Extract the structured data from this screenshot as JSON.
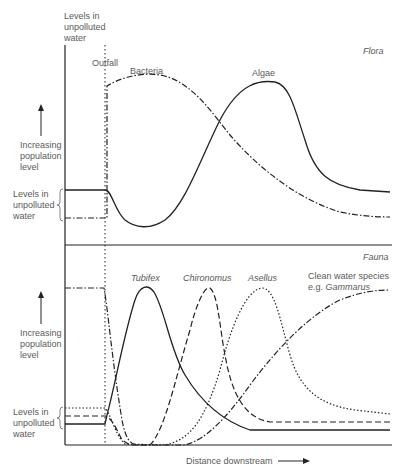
{
  "flora": {
    "section_label": "Flora",
    "top_label": "Levels in\nunpolluted\nwater",
    "outfall_label": "Outfall",
    "axis_label": "Increasing\npopulation\nlevel",
    "baseline_label": "Levels in\nunpolluted\nwater",
    "curves": [
      {
        "name": "Bacteria",
        "style": "dash-dot"
      },
      {
        "name": "Algae",
        "style": "solid"
      }
    ]
  },
  "fauna": {
    "section_label": "Fauna",
    "axis_label": "Increasing\npopulation\nlevel",
    "baseline_label": "Levels in\nunpolluted\nwater",
    "curves": [
      {
        "name": "Tubifex",
        "style": "solid"
      },
      {
        "name": "Chironomus",
        "style": "long-dash"
      },
      {
        "name": "Asellus",
        "style": "dotted"
      },
      {
        "name": "Clean water species",
        "name_line2_prefix": "e.g. ",
        "name_line2_italic": "Gammarus",
        "style": "dash-dot"
      }
    ]
  },
  "x_axis_label": "Distance downstream",
  "colors": {
    "line": "#222222",
    "text": "#5a5a5a"
  }
}
